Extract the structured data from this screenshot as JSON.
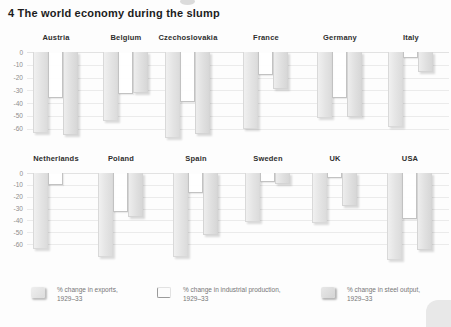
{
  "title": "4 The world economy during the slump",
  "colors": {
    "background": "#fdfdfd",
    "bar_gray": "#e4e4e4",
    "bar_white": "#ffffff",
    "gridline": "#ebebeb",
    "axis_text": "#8d8d8d",
    "label_text": "#2e2e2e"
  },
  "legend": {
    "items": [
      {
        "line1": "% change in exports,",
        "line2": "1929–33",
        "swatch": "gray-filled-square"
      },
      {
        "line1": "% change in industrial production,",
        "line2": "1929–33",
        "swatch": "white-outlined-square"
      },
      {
        "line1": "% change in steel output,",
        "line2": "1929–33",
        "swatch": "dark-gray-filled-square"
      }
    ]
  },
  "chart_data": {
    "type": "bar",
    "title": "4 The world economy during the slump",
    "series_names": [
      "% change in exports, 1929–33",
      "% change in industrial production, 1929–33",
      "% change in steel output, 1929–33"
    ],
    "yticks": [
      0,
      -10,
      -20,
      -30,
      -40,
      -50,
      -60
    ],
    "ylim": [
      0,
      -75
    ],
    "grid": true,
    "legend_position": "bottom",
    "rows": [
      {
        "countries": [
          "Austria",
          "Belgium",
          "Czechoslovakia",
          "France",
          "Germany",
          "Italy"
        ],
        "values": [
          [
            -63,
            -36,
            -65
          ],
          [
            -54,
            -33,
            -32
          ],
          [
            -67,
            -39,
            -64
          ],
          [
            -60,
            -18,
            -29
          ],
          [
            -52,
            -36,
            -51
          ],
          [
            -59,
            -5,
            -16
          ]
        ]
      },
      {
        "countries": [
          "Netherlands",
          "Poland",
          "Spain",
          "Sweden",
          "UK",
          "USA"
        ],
        "values": [
          [
            -64,
            -10,
            null
          ],
          [
            -71,
            -33,
            -37
          ],
          [
            -71,
            -17,
            -52
          ],
          [
            -41,
            -8,
            -9
          ],
          [
            -42,
            -4,
            -28
          ],
          [
            -73,
            -39,
            -65
          ]
        ]
      }
    ]
  }
}
